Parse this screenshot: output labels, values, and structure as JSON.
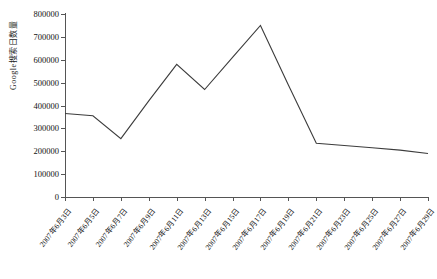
{
  "chart_data": {
    "type": "line",
    "title": "",
    "subtitle": "",
    "xlabel": "",
    "ylabel": "Google搜索日数量",
    "ylim": [
      0,
      800000
    ],
    "ytick_labels": [
      "800000",
      "700000",
      "600000",
      "500000",
      "400000",
      "300000",
      "200000",
      "100000",
      "0"
    ],
    "ytick_values": [
      800000,
      700000,
      600000,
      500000,
      400000,
      300000,
      200000,
      100000,
      0
    ],
    "grid": false,
    "legend": "none",
    "categories": [
      "2007年6月3日",
      "2007年6月5日",
      "2007年6月7日",
      "2007年6月9日",
      "2007年6月11日",
      "2007年6月13日",
      "2007年6月15日",
      "2007年6月17日",
      "2007年6月19日",
      "2007年6月21日",
      "2007年6月23日",
      "2007年6月25日",
      "2007年6月27日",
      "2007年6月29日"
    ],
    "x": [
      1,
      2,
      3,
      4,
      5,
      6,
      7,
      8,
      9,
      10,
      11,
      12,
      13,
      14
    ],
    "values": [
      365000,
      355000,
      255000,
      420000,
      580000,
      470000,
      610000,
      750000,
      490000,
      235000,
      225000,
      215000,
      205000,
      190000
    ],
    "series": [
      {
        "name": "Google搜索日数量",
        "color": "#3c3c3c",
        "values": [
          365000,
          355000,
          255000,
          420000,
          580000,
          470000,
          610000,
          750000,
          490000,
          235000,
          225000,
          215000,
          205000,
          190000
        ]
      }
    ],
    "line_color": "#3c3c3c",
    "axis_color": "#555555"
  }
}
